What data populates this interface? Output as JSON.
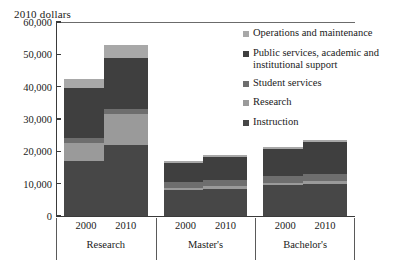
{
  "axis_title": "2010 dollars",
  "legend": {
    "items": [
      {
        "label": "Operations and maintenance",
        "color": "#a8a8a8"
      },
      {
        "label": "Public services, academic and institutional support",
        "color": "#3f3f3f"
      },
      {
        "label": "Student services",
        "color": "#6e6e6e"
      },
      {
        "label": "Research",
        "color": "#9a9a9a"
      },
      {
        "label": "Instruction",
        "color": "#474747"
      }
    ]
  },
  "chart_data": {
    "type": "bar",
    "title": "",
    "subtitle": "",
    "xlabel": "",
    "ylabel": "2010 dollars",
    "ylim": [
      0,
      60000
    ],
    "yticks": [
      0,
      10000,
      20000,
      30000,
      40000,
      50000,
      60000
    ],
    "ytick_labels": [
      "0",
      "10,000",
      "20,000",
      "30,000",
      "40,000",
      "50,000",
      "60,000"
    ],
    "grid": false,
    "stacked": true,
    "legend_position": "right",
    "groups": [
      "Research",
      "Master's",
      "Bachelor's"
    ],
    "categories": [
      "2000",
      "2010",
      "2000",
      "2010",
      "2000",
      "2010"
    ],
    "series": [
      {
        "name": "Instruction",
        "color": "#474747",
        "values": [
          17000,
          22000,
          8000,
          8500,
          9500,
          10000
        ]
      },
      {
        "name": "Research",
        "color": "#9a9a9a",
        "values": [
          5500,
          9500,
          700,
          800,
          600,
          700
        ]
      },
      {
        "name": "Student services",
        "color": "#6e6e6e",
        "values": [
          1500,
          1700,
          1700,
          1900,
          2200,
          2400
        ]
      },
      {
        "name": "Public services, academic and institutional support",
        "color": "#3f3f3f",
        "values": [
          15500,
          15800,
          6100,
          7200,
          8500,
          9700
        ]
      },
      {
        "name": "Operations and maintenance",
        "color": "#a8a8a8",
        "values": [
          3000,
          4000,
          500,
          600,
          700,
          700
        ]
      }
    ],
    "totals": [
      42500,
      53000,
      17000,
      19000,
      21500,
      23500
    ]
  }
}
